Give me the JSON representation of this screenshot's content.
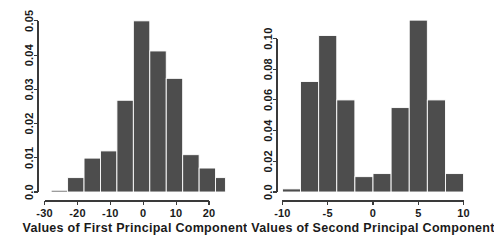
{
  "figure": {
    "background_color": "#ffffff",
    "bar_color": "#4d4d4d",
    "bar_edge_color": "#ffffff",
    "axis_color": "#3a3a3a",
    "panel_count": 2
  },
  "chart_data": [
    {
      "type": "bar",
      "title": "",
      "xlabel": "Values of First Principal Component",
      "ylabel": "",
      "xlim": [
        -32,
        27
      ],
      "ylim": [
        0,
        0.052
      ],
      "xticks": [
        -30,
        -20,
        -10,
        0,
        10,
        20
      ],
      "xtick_labels": [
        "-30",
        "-20",
        "-10",
        "0",
        "10",
        "20"
      ],
      "yticks": [
        0.0,
        0.01,
        0.02,
        0.03,
        0.04,
        0.05
      ],
      "ytick_labels": [
        "0.0",
        "0.01",
        "0.02",
        "0.03",
        "0.04",
        "0.05"
      ],
      "grid": false,
      "legend": null,
      "bin_edges": [
        -28.0,
        -23.0,
        -18.0,
        -13.0,
        -8.0,
        -3.0,
        2.0,
        7.0,
        12.0,
        17.0,
        22.0,
        25.0
      ],
      "bin_centers": [
        -25.5,
        -20.5,
        -15.5,
        -10.5,
        -5.5,
        -0.5,
        4.5,
        9.5,
        14.5,
        19.5,
        23.5
      ],
      "values": [
        0.0005,
        0.0042,
        0.0099,
        0.012,
        0.0268,
        0.05,
        0.0412,
        0.0332,
        0.0109,
        0.007,
        0.0042
      ]
    },
    {
      "type": "bar",
      "title": "",
      "xlabel": "Values of Second Principal Component",
      "ylabel": "",
      "xlim": [
        -10.6,
        10.6
      ],
      "ylim": [
        0,
        0.116
      ],
      "xticks": [
        -10,
        -5,
        0,
        5,
        10
      ],
      "xtick_labels": [
        "-10",
        "-5",
        "0",
        "5",
        "10"
      ],
      "yticks": [
        0.0,
        0.02,
        0.04,
        0.06,
        0.08,
        0.1
      ],
      "ytick_labels": [
        "0.0",
        "0.02",
        "0.04",
        "0.06",
        "0.08",
        "0.10"
      ],
      "grid": false,
      "legend": null,
      "bin_edges": [
        -10.0,
        -8.0,
        -6.0,
        -4.0,
        -2.0,
        0.0,
        2.0,
        4.0,
        6.0,
        8.0,
        10.0
      ],
      "bin_centers": [
        -9.0,
        -7.0,
        -5.0,
        -3.0,
        -1.0,
        1.0,
        3.0,
        5.0,
        7.0,
        9.0
      ],
      "values": [
        0.002,
        0.072,
        0.102,
        0.06,
        0.01,
        0.012,
        0.055,
        0.112,
        0.06,
        0.012
      ]
    }
  ]
}
